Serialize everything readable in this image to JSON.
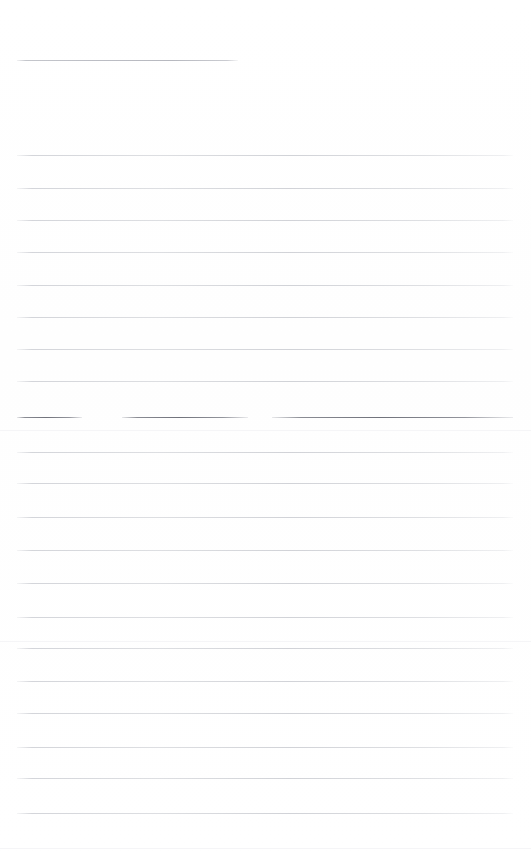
{
  "document": {
    "kind": "scanned-lined-page",
    "title": "Blank ruled page",
    "page_width": 531,
    "page_height": 857,
    "background_color": "#ffffff",
    "text_content": "",
    "is_blank": true
  },
  "ruling": {
    "line_color": "#cdcfd4",
    "dark_line_color": "#70727b",
    "left_margin": 17,
    "right_margin": 513,
    "line_spacing": 32.4,
    "line_count": 22
  },
  "header_rule": {
    "name": "top-short-rule",
    "x": 17,
    "y": 60,
    "width": 221,
    "color": "#aeb0b8"
  },
  "body_rules": [
    {
      "y": 155,
      "x": 17,
      "width": 496
    },
    {
      "y": 188,
      "x": 17,
      "width": 496
    },
    {
      "y": 220,
      "x": 17,
      "width": 496
    },
    {
      "y": 252,
      "x": 17,
      "width": 496
    },
    {
      "y": 285,
      "x": 17,
      "width": 496
    },
    {
      "y": 317,
      "x": 17,
      "width": 496
    },
    {
      "y": 349,
      "x": 17,
      "width": 496
    },
    {
      "y": 381,
      "x": 17,
      "width": 496
    },
    {
      "y": 452,
      "x": 17,
      "width": 496
    },
    {
      "y": 483,
      "x": 17,
      "width": 496
    },
    {
      "y": 517,
      "x": 17,
      "width": 496
    },
    {
      "y": 550,
      "x": 17,
      "width": 496
    },
    {
      "y": 583,
      "x": 17,
      "width": 496
    },
    {
      "y": 617,
      "x": 17,
      "width": 496
    },
    {
      "y": 648,
      "x": 17,
      "width": 496
    },
    {
      "y": 681,
      "x": 17,
      "width": 496
    },
    {
      "y": 713,
      "x": 17,
      "width": 496
    },
    {
      "y": 747,
      "x": 17,
      "width": 496
    },
    {
      "y": 778,
      "x": 17,
      "width": 496
    },
    {
      "y": 813,
      "x": 17,
      "width": 496
    }
  ],
  "broken_rule": {
    "name": "broken-dark-rule",
    "y": 417,
    "segments": [
      {
        "x": 17,
        "width": 65
      },
      {
        "x": 122,
        "width": 126
      },
      {
        "x": 272,
        "width": 241
      }
    ]
  },
  "speckles": [
    {
      "y": 430
    },
    {
      "y": 641
    },
    {
      "y": 848
    }
  ]
}
